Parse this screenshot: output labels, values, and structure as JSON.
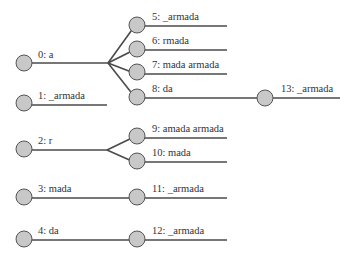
{
  "diagram": {
    "type": "trie",
    "colors": {
      "node_fill": "#c8c8c8",
      "node_stroke": "#555555",
      "edge": "#4a4a4a",
      "text": "#333333"
    },
    "nodes": [
      {
        "id": 0,
        "label": "0: a"
      },
      {
        "id": 1,
        "label": "1: _armada"
      },
      {
        "id": 2,
        "label": "2: r"
      },
      {
        "id": 3,
        "label": "3: mada"
      },
      {
        "id": 4,
        "label": "4: da"
      },
      {
        "id": 5,
        "label": "5: _armada"
      },
      {
        "id": 6,
        "label": "6: rmada"
      },
      {
        "id": 7,
        "label": "7: mada armada"
      },
      {
        "id": 8,
        "label": "8: da"
      },
      {
        "id": 9,
        "label": "9: amada armada"
      },
      {
        "id": 10,
        "label": "10: mada"
      },
      {
        "id": 11,
        "label": "11: _armada"
      },
      {
        "id": 12,
        "label": "12: _armada"
      },
      {
        "id": 13,
        "label": "13: _armada"
      }
    ],
    "edges": [
      {
        "from": 0,
        "to": 5
      },
      {
        "from": 0,
        "to": 6
      },
      {
        "from": 0,
        "to": 7
      },
      {
        "from": 0,
        "to": 8
      },
      {
        "from": 8,
        "to": 13
      },
      {
        "from": 2,
        "to": 9
      },
      {
        "from": 2,
        "to": 10
      },
      {
        "from": 3,
        "to": 11
      },
      {
        "from": 4,
        "to": 12
      }
    ]
  }
}
